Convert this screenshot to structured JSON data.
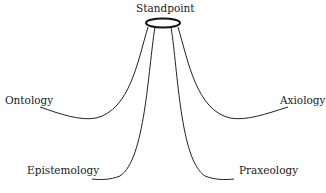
{
  "diagram": {
    "center": {
      "label": "Standpoint"
    },
    "branches": [
      {
        "label": "Ontology"
      },
      {
        "label": "Epistemology"
      },
      {
        "label": "Axiology"
      },
      {
        "label": "Praxeology"
      }
    ]
  }
}
